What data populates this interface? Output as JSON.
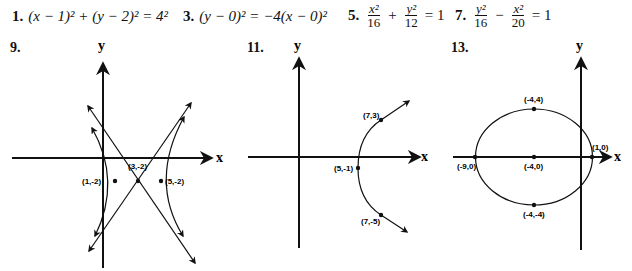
{
  "equations": [
    {
      "number": "1.",
      "text": "(x − 1)² + (y − 2)² = 4²"
    },
    {
      "number": "3.",
      "text": "(y − 0)² = −4(x − 0)²"
    },
    {
      "number": "5.",
      "frac1_num": "x²",
      "frac1_den": "16",
      "op": "+",
      "frac2_num": "y²",
      "frac2_den": "12",
      "rhs": "= 1"
    },
    {
      "number": "7.",
      "frac1_num": "y²",
      "frac1_den": "16",
      "op": "−",
      "frac2_num": "x²",
      "frac2_den": "20",
      "rhs": "= 1"
    }
  ],
  "graphs": [
    {
      "number": "9.",
      "type": "hyperbola",
      "x_axis_label": "x",
      "y_axis_label": "y",
      "points": [
        {
          "label": "(1,-2)"
        },
        {
          "label": "(3,-2)"
        },
        {
          "label": "(5,-2)"
        }
      ]
    },
    {
      "number": "11.",
      "type": "parabola",
      "x_axis_label": "x",
      "y_axis_label": "y",
      "points": [
        {
          "label": "(7,3)"
        },
        {
          "label": "(5,-1)"
        },
        {
          "label": "(7,-5)"
        }
      ]
    },
    {
      "number": "13.",
      "type": "ellipse",
      "x_axis_label": "x",
      "y_axis_label": "y",
      "points": [
        {
          "label": "(-4,4)"
        },
        {
          "label": "(1,0)"
        },
        {
          "label": "(-9,0)"
        },
        {
          "label": "(-4,0)"
        },
        {
          "label": "(-4,-4)"
        }
      ]
    }
  ]
}
